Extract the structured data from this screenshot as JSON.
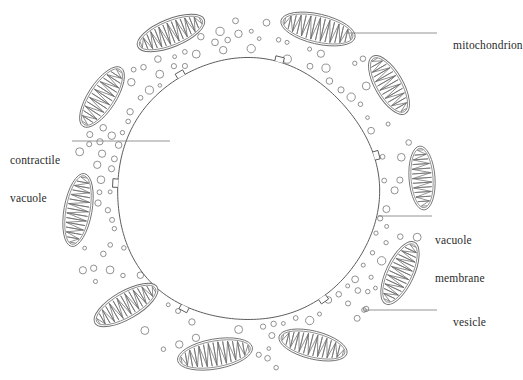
{
  "figure": {
    "name": "contractile-vacuole-diagram",
    "background_color": "#ffffff",
    "line_color": "#4a4a4a",
    "organelle_line_color": "#6e6e6e",
    "label_color": "#2b2b2b"
  },
  "labels": [
    {
      "id": "mitochondrion",
      "text": "mitochondrion",
      "x": 441,
      "y": 26,
      "leader": {
        "x1": 347,
        "y1": 33,
        "x2": 437,
        "y2": 33
      }
    },
    {
      "id": "contractile-vacuole",
      "text": "contractile\nvacuole",
      "line1": "contractile",
      "line2": "vacuole",
      "x": 10,
      "y": 129,
      "leader": {
        "x1": 72,
        "y1": 141,
        "x2": 170,
        "y2": 141
      }
    },
    {
      "id": "vacuole-membrane",
      "text": "vacuole\nmembrane",
      "line1": "vacuole",
      "line2": "membrane",
      "x": 435,
      "y": 209,
      "leader": {
        "x1": 378,
        "y1": 216,
        "x2": 432,
        "y2": 216
      }
    },
    {
      "id": "vesicle",
      "text": "vesicle",
      "x": 441,
      "y": 303,
      "leader": {
        "x1": 364,
        "y1": 310,
        "x2": 437,
        "y2": 310
      }
    }
  ],
  "vacuole": {
    "center_x": 247,
    "center_y": 190,
    "radius": 131,
    "notches": [
      {
        "angle_deg": -76
      },
      {
        "angle_deg": -15
      },
      {
        "angle_deg": 55
      },
      {
        "angle_deg": 118
      },
      {
        "angle_deg": 183
      },
      {
        "angle_deg": 240
      }
    ]
  },
  "mitochondria": [
    {
      "id": "mito-1",
      "cx": 171,
      "cy": 33,
      "rx": 36,
      "ry": 14,
      "rot": -22
    },
    {
      "id": "mito-2",
      "cx": 318,
      "cy": 29,
      "rx": 38,
      "ry": 15,
      "rot": 13
    },
    {
      "id": "mito-3",
      "cx": 102,
      "cy": 97,
      "rx": 35,
      "ry": 14,
      "rot": -57
    },
    {
      "id": "mito-4",
      "cx": 389,
      "cy": 85,
      "rx": 33,
      "ry": 14,
      "rot": 60
    },
    {
      "id": "mito-5",
      "cx": 422,
      "cy": 178,
      "rx": 32,
      "ry": 13,
      "rot": 86
    },
    {
      "id": "mito-6",
      "cx": 78,
      "cy": 210,
      "rx": 37,
      "ry": 14,
      "rot": 100
    },
    {
      "id": "mito-7",
      "cx": 400,
      "cy": 273,
      "rx": 34,
      "ry": 14,
      "rot": 115
    },
    {
      "id": "mito-8",
      "cx": 126,
      "cy": 305,
      "rx": 36,
      "ry": 14,
      "rot": 150
    },
    {
      "id": "mito-9",
      "cx": 313,
      "cy": 345,
      "rx": 35,
      "ry": 14,
      "rot": 194
    },
    {
      "id": "mito-10",
      "cx": 215,
      "cy": 354,
      "rx": 38,
      "ry": 15,
      "rot": 170
    }
  ],
  "vesicles": {
    "count": 118,
    "min_radius": 1.8,
    "max_radius": 4.2,
    "band_inner_offset": 5,
    "band_outer_offset": 52
  },
  "icons": {
    "mitochondrion_shape": "ellipse-with-cristae",
    "vesicle_shape": "small-circle",
    "membrane_shape": "large-circle-with-notches"
  }
}
